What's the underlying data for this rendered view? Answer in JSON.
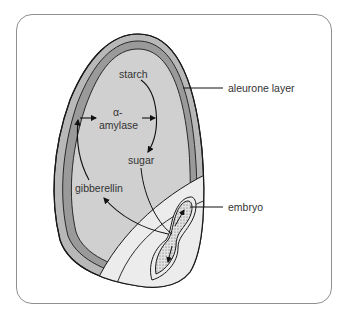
{
  "diagram": {
    "labels": {
      "starch": "starch",
      "alpha": "α-",
      "amylase": "amylase",
      "sugar": "sugar",
      "gibberellin": "gibberellin",
      "aleurone_layer": "aleurone layer",
      "embryo": "embryo"
    },
    "colors": {
      "frame": "#8f8f8f",
      "seed_coat": "#b8b8b8",
      "aleurone": "#9a9a9a",
      "endosperm": "#d0d0d0",
      "scutellum": "#ececec",
      "embryo": "#d8d8d8",
      "outline": "#1a1a1a"
    }
  }
}
